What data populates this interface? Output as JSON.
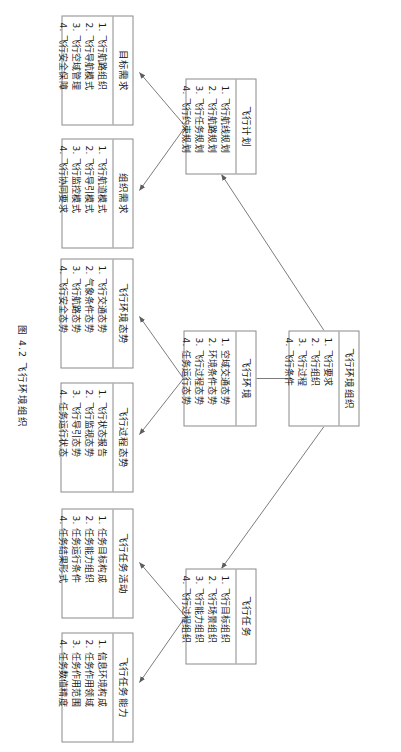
{
  "figure": {
    "caption": "图 4.2  飞行环境组织",
    "orientation_degrees": 90
  },
  "nodes": {
    "root": {
      "title": "飞行环境组织",
      "items": [
        "1. 飞行要求",
        "2. 飞行组织",
        "3. 飞行过程",
        "4. 飞行条件"
      ]
    },
    "plan": {
      "title": "飞行计划",
      "items": [
        "1. 飞行航线规划",
        "2. 飞行航路规划",
        "3. 飞行任务规划",
        "4. 飞行约束规划"
      ]
    },
    "environment": {
      "title": "飞行环境",
      "items": [
        "1. 空域交通态势",
        "2. 环境条件态势",
        "3. 飞行过程态势",
        "4. 任务运行态势"
      ]
    },
    "task": {
      "title": "飞行任务",
      "items": [
        "1. 飞行目标组织",
        "2. 飞行场景组织",
        "3. 飞行能力组织",
        "4. 飞行过程组织"
      ]
    },
    "goal_requirement": {
      "title": "目标需求",
      "items": [
        "1. 飞行航路组织",
        "2. 飞行导航模式",
        "3. 飞行空域管理",
        "4. 飞行安全保障"
      ]
    },
    "org_requirement": {
      "title": "组织需求",
      "items": [
        "1. 飞行航道模式",
        "2. 飞行导引模式",
        "3. 飞行监控模式",
        "4. 飞行协同要求"
      ]
    },
    "env_situation": {
      "title": "飞行环境态势",
      "items": [
        "1. 飞行交通态势",
        "2. 气象条件态势",
        "3. 飞行航路态势",
        "4. 飞行安全态势"
      ]
    },
    "process_situation": {
      "title": "飞行过程态势",
      "items": [
        "1. 飞行状态报告",
        "2. 飞行监视态势",
        "3. 飞行导引态势",
        "4. 任务运行状态"
      ]
    },
    "task_activity": {
      "title": "飞行任务活动",
      "items": [
        "1. 任务目标构成",
        "2. 任务能力组织",
        "3. 任务运行条件",
        "4. 任务结果形式"
      ]
    },
    "task_capability": {
      "title": "飞行任务能力",
      "items": [
        "1. 信息环境构成",
        "2. 任务作用领域",
        "3. 任务作用范围",
        "4. 任务数值精度"
      ]
    }
  },
  "colors": {
    "stroke": "#8a8a8a",
    "line": "#6d6d6d",
    "text": "#1a1a1a",
    "background": "#ffffff"
  }
}
